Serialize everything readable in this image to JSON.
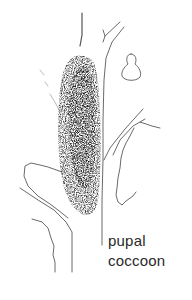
{
  "figure": {
    "style": "pen-and-ink line drawing",
    "colors": {
      "ink": "#1a1a1a",
      "line": "#6a6a6a",
      "background": "#ffffff"
    }
  },
  "labels": {
    "line1": "pupal",
    "line2": "coccoon"
  }
}
